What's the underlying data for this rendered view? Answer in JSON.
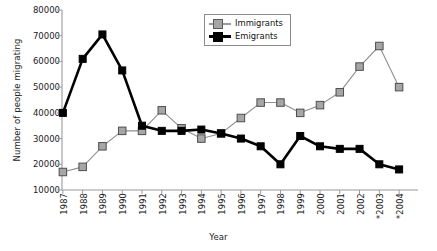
{
  "chart_data": {
    "type": "line",
    "title": "",
    "xlabel": "Year",
    "ylabel": "Number of people migrating",
    "categories": [
      "1987",
      "1988",
      "1989",
      "1990",
      "1991",
      "1992",
      "1993",
      "1994",
      "1995",
      "1996",
      "1997",
      "1998",
      "1999",
      "2000",
      "2001",
      "2002",
      "2003",
      "2004"
    ],
    "tick_labels_x": [
      "1987",
      "1988",
      "1989",
      "1990",
      "1991",
      "1992",
      "1993",
      "1994",
      "1995",
      "1996",
      "1997",
      "1998",
      "1999",
      "2000",
      "2001",
      "2002",
      "*2003",
      "*2004"
    ],
    "tick_labels_y": [
      "10000",
      "20000",
      "30000",
      "40000",
      "50000",
      "60000",
      "70000",
      "80000"
    ],
    "ylim": [
      10000,
      80000
    ],
    "ytick_values": [
      10000,
      20000,
      30000,
      40000,
      50000,
      60000,
      70000,
      80000
    ],
    "grid": false,
    "legend_position": "top-center",
    "footnote_marker": "*",
    "footnote_years": [
      "2003",
      "2004"
    ],
    "series": [
      {
        "name": "Immigrants",
        "color": "#8f8f8f",
        "marker": "square",
        "marker_fill": "#a6a6a6",
        "values": [
          17000,
          19000,
          27000,
          33000,
          33000,
          41000,
          34000,
          30000,
          32000,
          38000,
          44000,
          44000,
          40000,
          43000,
          48000,
          58000,
          66000,
          50000
        ]
      },
      {
        "name": "Emigrants",
        "color": "#000000",
        "marker": "square",
        "marker_fill": "#000000",
        "values": [
          40000,
          61000,
          70500,
          56500,
          35000,
          33000,
          33000,
          33500,
          32000,
          30000,
          27000,
          20000,
          31000,
          27000,
          26000,
          26000,
          20000,
          18000
        ]
      }
    ]
  },
  "legend": {
    "items": [
      {
        "label": "Immigrants"
      },
      {
        "label": "Emigrants"
      }
    ]
  },
  "axes": {
    "x_title": "Year",
    "y_title": "Number of people migrating"
  }
}
